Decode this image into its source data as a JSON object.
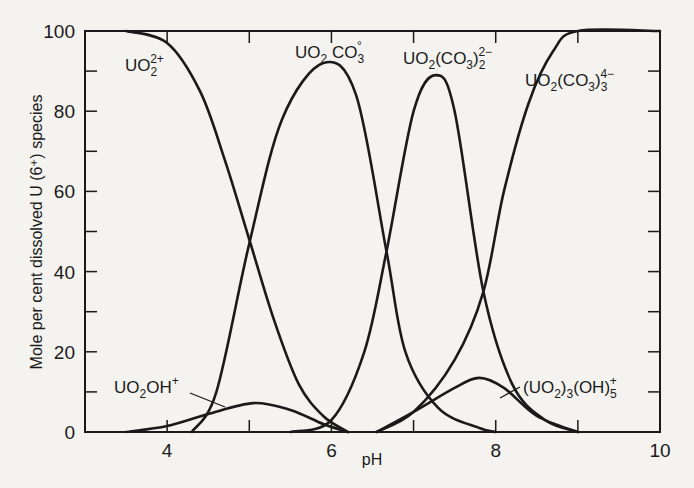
{
  "chart_data": {
    "type": "line",
    "title": "",
    "xlabel": "pH",
    "ylabel": "Mole per cent dissolved U (6⁺) species",
    "xlim": [
      3,
      10
    ],
    "ylim": [
      0,
      100
    ],
    "x_ticks": [
      4,
      5,
      6,
      7,
      8,
      9,
      10
    ],
    "x_tick_labels": [
      "4",
      "6",
      "8",
      "10"
    ],
    "y_ticks": [
      0,
      10,
      20,
      30,
      40,
      50,
      60,
      70,
      80,
      90,
      100
    ],
    "y_tick_labels": [
      "0",
      "20",
      "40",
      "60",
      "80",
      "100"
    ],
    "grid": false,
    "legend": "inline labels",
    "series": [
      {
        "name": "UO2 2+",
        "label": "UO₂²⁺",
        "points": [
          [
            3.5,
            100
          ],
          [
            4.0,
            97
          ],
          [
            4.4,
            85
          ],
          [
            4.7,
            68
          ],
          [
            5.0,
            48
          ],
          [
            5.3,
            28
          ],
          [
            5.6,
            12
          ],
          [
            5.9,
            4
          ],
          [
            6.2,
            0
          ]
        ]
      },
      {
        "name": "UO2OH+",
        "label": "UO₂OH⁺",
        "points": [
          [
            3.5,
            0
          ],
          [
            4.0,
            1.5
          ],
          [
            4.5,
            4.5
          ],
          [
            5.05,
            7.2
          ],
          [
            5.5,
            5.5
          ],
          [
            5.9,
            2
          ],
          [
            6.2,
            0
          ]
        ]
      },
      {
        "name": "UO2CO3",
        "label": "UO₂CO₃°",
        "points": [
          [
            4.3,
            0
          ],
          [
            4.6,
            10
          ],
          [
            5.0,
            47
          ],
          [
            5.4,
            78
          ],
          [
            5.9,
            92
          ],
          [
            6.3,
            84
          ],
          [
            6.67,
            45
          ],
          [
            6.9,
            20
          ],
          [
            7.3,
            6
          ],
          [
            7.8,
            1
          ],
          [
            8.0,
            0
          ]
        ]
      },
      {
        "name": "UO2(CO3)2 2-",
        "label": "UO₂(CO₃)₂²⁻",
        "points": [
          [
            5.5,
            0
          ],
          [
            6.0,
            3
          ],
          [
            6.4,
            20
          ],
          [
            6.67,
            45
          ],
          [
            7.0,
            80
          ],
          [
            7.27,
            89
          ],
          [
            7.5,
            80
          ],
          [
            7.85,
            35
          ],
          [
            8.2,
            12
          ],
          [
            8.6,
            3
          ],
          [
            9.0,
            0
          ]
        ]
      },
      {
        "name": "UO2(CO3)3 4-",
        "label": "UO₂(CO₃)₃⁴⁻",
        "points": [
          [
            6.55,
            0
          ],
          [
            7.0,
            5
          ],
          [
            7.5,
            18
          ],
          [
            7.85,
            35
          ],
          [
            8.1,
            60
          ],
          [
            8.4,
            82
          ],
          [
            8.7,
            95
          ],
          [
            9.0,
            100
          ],
          [
            10.0,
            100
          ]
        ]
      },
      {
        "name": "(UO2)3(OH)5+",
        "label": "(UO₂)₃(OH)₅⁺",
        "points": [
          [
            6.55,
            0
          ],
          [
            7.0,
            5
          ],
          [
            7.5,
            11
          ],
          [
            7.8,
            13.5
          ],
          [
            8.1,
            11
          ],
          [
            8.5,
            4
          ],
          [
            9.0,
            0
          ]
        ]
      }
    ]
  },
  "axes": {
    "x_label": "pH",
    "y_label": "Mole per cent dissolved U (6⁺) species",
    "x_ticks": [
      "4",
      "6",
      "8",
      "10"
    ],
    "y_ticks": [
      "0",
      "20",
      "40",
      "60",
      "80",
      "100"
    ]
  },
  "labels": {
    "uo2": "UO₂²⁺",
    "uo2co3": "UO₂CO₃°",
    "uo2co3_2": "UO₂(CO₃)₂²⁻",
    "uo2co3_3": "UO₂(CO₃)₃⁴⁻",
    "uo2oh": "UO₂OH⁺",
    "uo2_3oh5": "(UO₂)₃(OH)₅⁺"
  },
  "colors": {
    "line": "#1a1a1a",
    "background": "#f4f3ef"
  }
}
